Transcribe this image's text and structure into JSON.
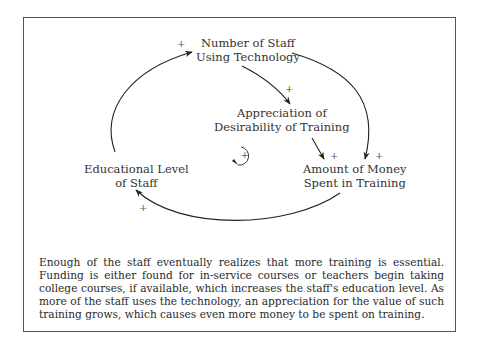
{
  "diagram": {
    "type": "causal-loop",
    "nodes": {
      "staff_tech": {
        "line1": "Number of Staff",
        "line2": "Using Technology"
      },
      "appreciation": {
        "line1": "Appreciation of",
        "line2": "Desirability of Training"
      },
      "money": {
        "line1": "Amount of Money",
        "line2": "Spent in Training"
      },
      "education": {
        "line1": "Educational Level",
        "line2": "of Staff"
      }
    },
    "links": [
      {
        "from": "Educational Level of Staff",
        "to": "Number of Staff Using Technology",
        "polarity": "+"
      },
      {
        "from": "Number of Staff Using Technology",
        "to": "Appreciation of Desirability of Training",
        "polarity": "+"
      },
      {
        "from": "Appreciation of Desirability of Training",
        "to": "Amount of Money Spent in Training",
        "polarity": "+"
      },
      {
        "from": "Number of Staff Using Technology",
        "to": "Amount of Money Spent in Training",
        "polarity": "+"
      },
      {
        "from": "Amount of Money Spent in Training",
        "to": "Educational Level of Staff",
        "polarity": "+"
      }
    ],
    "polarity_sign": "+",
    "loop_label": "+",
    "loop_type": "reinforcing"
  },
  "caption": "Enough of the staff eventually realizes that more training is essential. Funding is either found for in-service courses or teachers begin taking college courses, if available, which increases the staff's education level. As more of the staff uses the technology, an appreciation for the value of such training grows, which causes even more money to be spent on training."
}
